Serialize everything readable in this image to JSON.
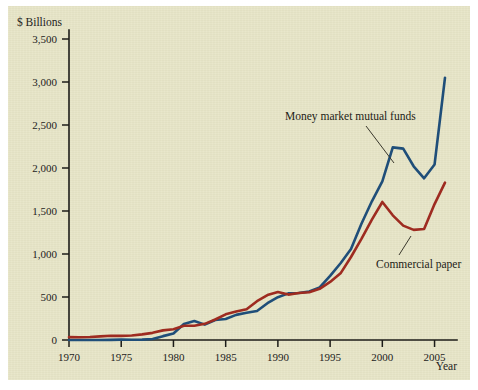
{
  "figure": {
    "background_color": "#e8e6c8",
    "page_color": "#ffffff"
  },
  "axes": {
    "y_axis_title": "$ Billions",
    "x_axis_title": "Year",
    "y_ticks": [
      "0",
      "500",
      "1,000",
      "1,500",
      "2,000",
      "2,500",
      "3,000",
      "3,500"
    ],
    "x_ticks": [
      "1970",
      "1975",
      "1980",
      "1985",
      "1990",
      "1995",
      "2000",
      "2005"
    ]
  },
  "annotations": {
    "money_market_label": "Money market mutual funds",
    "commercial_paper_label": "Commercial paper"
  },
  "colors": {
    "money_market": "#1f4e79",
    "commercial_paper": "#9e2b20",
    "axis": "#1c1c18",
    "text": "#23221c"
  },
  "chart_data": {
    "type": "line",
    "title": "",
    "xlabel": "Year",
    "ylabel": "$ Billions",
    "xlim": [
      1970,
      2006
    ],
    "ylim": [
      0,
      3500
    ],
    "grid": false,
    "legend": "inline annotations with leader lines",
    "x": [
      1970,
      1971,
      1972,
      1973,
      1974,
      1975,
      1976,
      1977,
      1978,
      1979,
      1980,
      1981,
      1982,
      1983,
      1984,
      1985,
      1986,
      1987,
      1988,
      1989,
      1990,
      1991,
      1992,
      1993,
      1994,
      1995,
      1996,
      1997,
      1998,
      1999,
      2000,
      2001,
      2002,
      2003,
      2004,
      2005,
      2006
    ],
    "series": [
      {
        "name": "Money market mutual funds",
        "color": "#1f4e79",
        "values": [
          0,
          0,
          0,
          0,
          2,
          4,
          3,
          4,
          11,
          45,
          76,
          186,
          220,
          179,
          233,
          244,
          292,
          316,
          338,
          428,
          498,
          542,
          546,
          565,
          611,
          745,
          892,
          1059,
          1352,
          1613,
          1845,
          2240,
          2225,
          2020,
          1880,
          2040,
          3050
        ]
      },
      {
        "name": "Commercial paper",
        "color": "#9e2b20",
        "values": [
          33,
          32,
          35,
          42,
          49,
          48,
          53,
          65,
          83,
          112,
          125,
          165,
          166,
          188,
          238,
          299,
          331,
          357,
          451,
          522,
          558,
          528,
          546,
          555,
          595,
          675,
          775,
          965,
          1175,
          1400,
          1605,
          1450,
          1330,
          1280,
          1290,
          1580,
          1830
        ]
      }
    ]
  }
}
